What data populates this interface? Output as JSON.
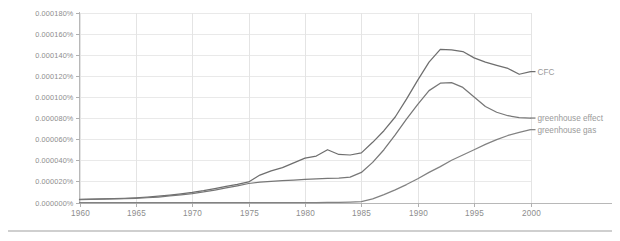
{
  "chart_data": {
    "type": "line",
    "title": "",
    "subtitle": "",
    "xlabel": "",
    "ylabel": "",
    "grid": true,
    "legend_position": "right-inline",
    "xlim": [
      1960,
      2000
    ],
    "ylim": [
      0.0,
      0.00018
    ],
    "x_tick_labels": [
      "1960",
      "1965",
      "1970",
      "1975",
      "1980",
      "1985",
      "1990",
      "1995",
      "2000"
    ],
    "x_ticks": [
      1960,
      1965,
      1970,
      1975,
      1980,
      1985,
      1990,
      1995,
      2000
    ],
    "y_tick_labels": [
      "0.000000%",
      "0.000020%",
      "0.000040%",
      "0.000060%",
      "0.000080%",
      "0.000100%",
      "0.000120%",
      "0.000140%",
      "0.000160%",
      "0.000180%"
    ],
    "y_ticks": [
      0.0,
      2e-05,
      4e-05,
      6e-05,
      8e-05,
      0.0001,
      0.00012,
      0.00014,
      0.00016,
      0.00018
    ],
    "x": [
      1960,
      1961,
      1962,
      1963,
      1964,
      1965,
      1966,
      1967,
      1968,
      1969,
      1970,
      1971,
      1972,
      1973,
      1974,
      1975,
      1976,
      1977,
      1978,
      1979,
      1980,
      1981,
      1982,
      1983,
      1984,
      1985,
      1986,
      1987,
      1988,
      1989,
      1990,
      1991,
      1992,
      1993,
      1994,
      1995,
      1996,
      1997,
      1998,
      1999,
      2000
    ],
    "series": [
      {
        "name": "CFC",
        "color": "#6e6e6e",
        "label_x": 2001,
        "values": [
          3e-06,
          3.2e-06,
          3.4e-06,
          3.7e-06,
          4e-06,
          4.5e-06,
          5.2e-06,
          6e-06,
          7e-06,
          8.2e-06,
          9.5e-06,
          1.12e-05,
          1.32e-05,
          1.52e-05,
          1.72e-05,
          1.95e-05,
          2.6e-05,
          3e-05,
          3.3e-05,
          3.75e-05,
          4.2e-05,
          4.4e-05,
          5e-05,
          4.55e-05,
          4.5e-05,
          4.7e-05,
          5.7e-05,
          6.8e-05,
          8.1e-05,
          9.8e-05,
          0.000116,
          0.000133,
          0.000145,
          0.0001445,
          0.000143,
          0.000137,
          0.000133,
          0.00013,
          0.000127,
          0.0001215,
          0.000124
        ]
      },
      {
        "name": "greenhouse effect",
        "color": "#777777",
        "label_x": 2001,
        "values": [
          2.8e-06,
          3e-06,
          3.2e-06,
          3.4e-06,
          3.7e-06,
          4e-06,
          4.5e-06,
          5.2e-06,
          6.2e-06,
          7.3e-06,
          8.5e-06,
          1e-05,
          1.18e-05,
          1.38e-05,
          1.58e-05,
          1.8e-05,
          1.92e-05,
          2e-05,
          2.07e-05,
          2.13e-05,
          2.2e-05,
          2.24e-05,
          2.28e-05,
          2.32e-05,
          2.4e-05,
          2.85e-05,
          3.8e-05,
          5e-05,
          6.4e-05,
          7.9e-05,
          9.3e-05,
          0.000106,
          0.000113,
          0.0001135,
          0.000109,
          0.0001,
          9.1e-05,
          8.55e-05,
          8.22e-05,
          8.05e-05,
          8e-05
        ]
      },
      {
        "name": "greenhouse gas",
        "color": "#828282",
        "label_x": 2001,
        "values": [
          0.0,
          0.0,
          0.0,
          0.0,
          0.0,
          0.0,
          0.0,
          0.0,
          0.0,
          0.0,
          0.0,
          0.0,
          0.0,
          0.0,
          0.0,
          0.0,
          0.0,
          0.0,
          0.0,
          0.0,
          0.0,
          0.0,
          1e-07,
          2e-07,
          4e-07,
          8e-07,
          3.5e-06,
          7.5e-06,
          1.2e-05,
          1.7e-05,
          2.25e-05,
          2.85e-05,
          3.4e-05,
          4e-05,
          4.5e-05,
          5e-05,
          5.5e-05,
          5.95e-05,
          6.35e-05,
          6.65e-05,
          6.9e-05
        ]
      }
    ]
  },
  "axis": {
    "axis_color": "#b8b8b8",
    "grid_color": "#e9e9e9",
    "tick_text_color": "#8d8d8d"
  },
  "footer": {
    "rule_color": "#cfcfcf"
  }
}
